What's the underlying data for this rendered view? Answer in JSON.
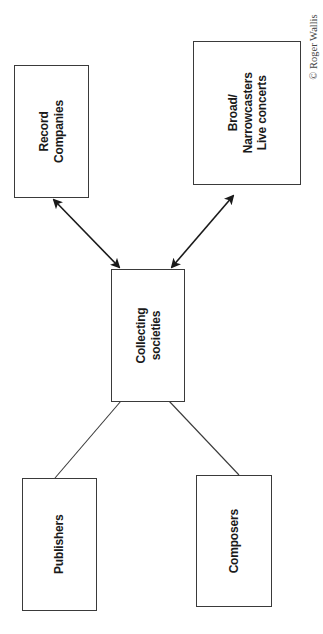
{
  "diagram": {
    "type": "relationship-diagram",
    "orientation": "rotated-90-ccw",
    "nodes": [
      {
        "id": "record",
        "lines": [
          "Record",
          "Companies"
        ]
      },
      {
        "id": "broad",
        "lines": [
          "Broad/",
          "Narrowcasters",
          "Live concerts"
        ]
      },
      {
        "id": "collecting",
        "lines": [
          "Collecting",
          "societies"
        ]
      },
      {
        "id": "publishers",
        "lines": [
          "Publishers"
        ]
      },
      {
        "id": "composers",
        "lines": [
          "Composers"
        ]
      }
    ],
    "edges": [
      {
        "from": "collecting",
        "to": "record",
        "style": "double-arrow"
      },
      {
        "from": "collecting",
        "to": "broad",
        "style": "double-arrow"
      },
      {
        "from": "collecting",
        "to": "publishers",
        "style": "line"
      },
      {
        "from": "collecting",
        "to": "composers",
        "style": "line"
      }
    ],
    "copyright": "© Roger Wallis"
  },
  "colors": {
    "stroke": "#3a3a3a",
    "text": "#1a1a1a",
    "background": "#ffffff"
  }
}
